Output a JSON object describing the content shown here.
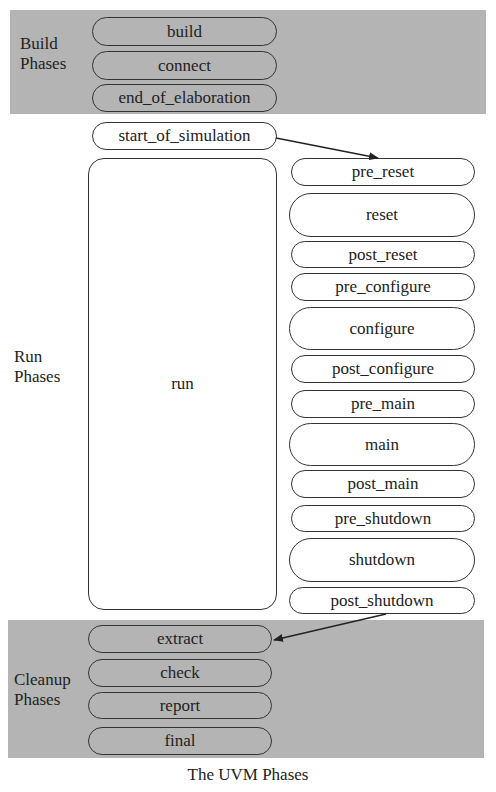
{
  "caption": "The UVM Phases",
  "groups": {
    "build": {
      "label_line1": "Build",
      "label_line2": "Phases",
      "phases": [
        "build",
        "connect",
        "end_of_elaboration"
      ]
    },
    "run": {
      "label_line1": "Run",
      "label_line2": "Phases",
      "start": "start_of_simulation",
      "run": "run",
      "runtime_phases": [
        "pre_reset",
        "reset",
        "post_reset",
        "pre_configure",
        "configure",
        "post_configure",
        "pre_main",
        "main",
        "post_main",
        "pre_shutdown",
        "shutdown",
        "post_shutdown"
      ]
    },
    "cleanup": {
      "label_line1": "Cleanup",
      "label_line2": "Phases",
      "phases": [
        "extract",
        "check",
        "report",
        "final"
      ]
    }
  },
  "arrows": [
    {
      "from": "start_of_simulation",
      "to": "pre_reset"
    },
    {
      "from": "post_shutdown",
      "to": "extract"
    }
  ],
  "colors": {
    "band_fill": "#b4b4b4",
    "outline": "#333333",
    "background": "#ffffff"
  }
}
